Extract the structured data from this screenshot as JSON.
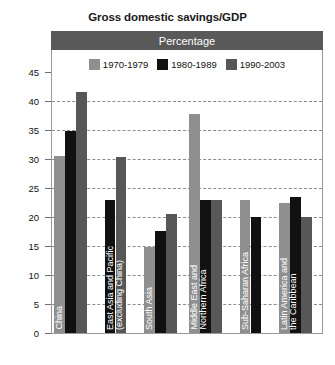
{
  "chart_data": {
    "type": "bar",
    "title": "Gross domestic savings/GDP",
    "subtitle": "Percentage",
    "xlabel": "",
    "ylabel": "",
    "ylim": [
      0,
      45
    ],
    "ytick_step": 5,
    "yticks": [
      "0",
      "5",
      "10",
      "15",
      "20",
      "25",
      "30",
      "35",
      "40",
      "45"
    ],
    "grid": true,
    "legend_position": "top-inside",
    "categories": [
      "China",
      "East Asia and Pacific (excluding China)",
      "South Asia",
      "Middle East and Northern Africa",
      "Sub-Saharan Africa",
      "Latin America and the Caribbean"
    ],
    "category_lines": [
      [
        "China"
      ],
      [
        "East Asia and Pacific",
        "(excluding China)"
      ],
      [
        "South Asia"
      ],
      [
        "Middle East and",
        "Northern Africa"
      ],
      [
        "Sub-Saharan Africa"
      ],
      [
        "Latin America and",
        "the Caribbean"
      ]
    ],
    "series": [
      {
        "name": "1970-1979",
        "color": "#8f8f8f",
        "values": [
          30.5,
          null,
          14.8,
          37.7,
          23.0,
          22.5
        ]
      },
      {
        "name": "1980-1989",
        "color": "#111111",
        "values": [
          34.8,
          23.0,
          17.6,
          23.0,
          20.0,
          23.4
        ]
      },
      {
        "name": "1990-2003",
        "color": "#575757",
        "values": [
          41.5,
          30.3,
          20.5,
          23.0,
          null,
          20.0
        ]
      }
    ]
  },
  "colors": {
    "header_band": "#595959",
    "frame": "#9a9a9a",
    "gridline": "#8c8c8c",
    "text": "#111111",
    "category_label": "#ffffff"
  }
}
